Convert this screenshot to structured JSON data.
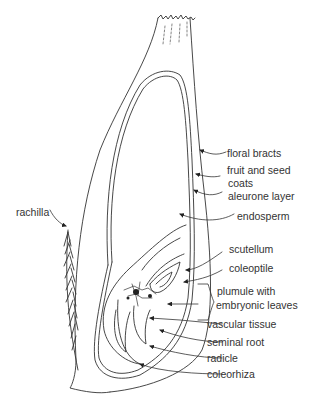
{
  "diagram": {
    "colors": {
      "line": "#333333",
      "background": "#ffffff",
      "text": "#333333"
    },
    "labels": {
      "floral_bracts": "floral bracts",
      "fruit_and_seed": "fruit and seed",
      "coats": "coats",
      "aleurone_layer": "aleurone layer",
      "endosperm": "endosperm",
      "rachilla": "rachilla",
      "scutellum": "scutellum",
      "coleoptile": "coleoptile",
      "plumule_with": "plumule with",
      "embryonic_leaves": "embryonic leaves",
      "vascular_tissue": "vascular tissue",
      "seminal_root": "seminal root",
      "radicle": "radicle",
      "coleorhiza": "coleorhiza"
    }
  }
}
